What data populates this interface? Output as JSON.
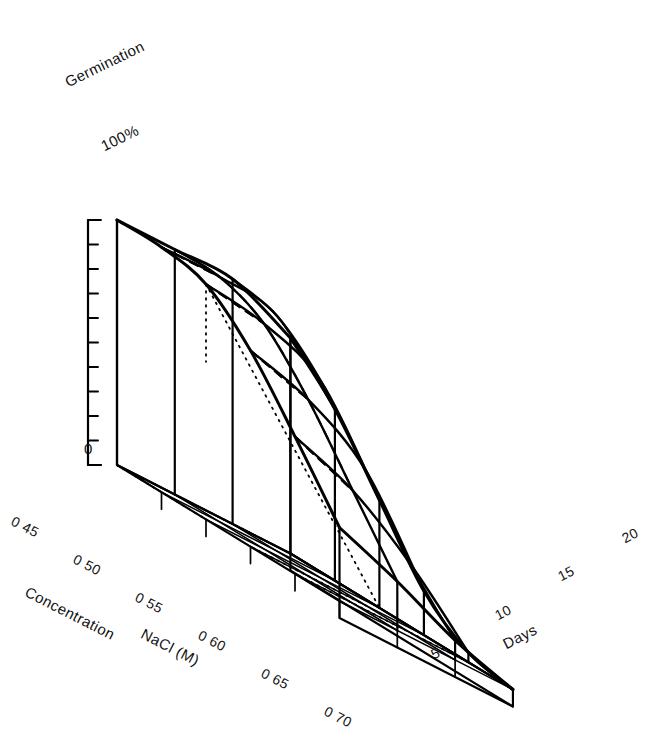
{
  "figure": {
    "kind": "3d-surface-mesh",
    "background_color": "#ffffff",
    "ink_color": "#000000"
  },
  "axes": {
    "vertical": {
      "title": "Germination",
      "max_label": "100%",
      "min_label": "0",
      "tick_count": 10,
      "range": [
        0,
        100
      ],
      "units": "%"
    },
    "left_horizontal": {
      "title_line1": "Concentration",
      "title_line2": "NaCl (M)",
      "tick_labels": [
        "0 45",
        "0 50",
        "0 55",
        "0 60",
        "0 65",
        "0 70"
      ],
      "values": [
        0.45,
        0.5,
        0.55,
        0.6,
        0.65,
        0.7
      ]
    },
    "right_horizontal": {
      "title": "Days",
      "tick_labels": [
        "5",
        "10",
        "15",
        "20"
      ],
      "values": [
        5,
        10,
        15,
        20
      ]
    }
  },
  "chart_data": {
    "type": "surface",
    "title": "",
    "xlabel": "Concentration NaCl (M)",
    "ylabel": "Days",
    "zlabel": "Germination",
    "zlim": [
      0,
      100
    ],
    "grid": true,
    "legend": "none",
    "x": [
      0.45,
      0.5,
      0.55,
      0.6,
      0.65,
      0.7
    ],
    "y": [
      5,
      10,
      15,
      20
    ],
    "z_units": "%",
    "z_note": "rows = concentration 0.45..0.70, columns = days 5,10,15,20",
    "z": [
      [
        88,
        100,
        100,
        100
      ],
      [
        70,
        96,
        100,
        100
      ],
      [
        44,
        80,
        92,
        96
      ],
      [
        18,
        55,
        72,
        80
      ],
      [
        4,
        28,
        46,
        56
      ],
      [
        0,
        8,
        20,
        30
      ]
    ]
  },
  "annotations": {
    "dotted_reference_lines": "origin guide lines on back walls",
    "dashed_lines": "hidden mesh edges behind surface"
  }
}
